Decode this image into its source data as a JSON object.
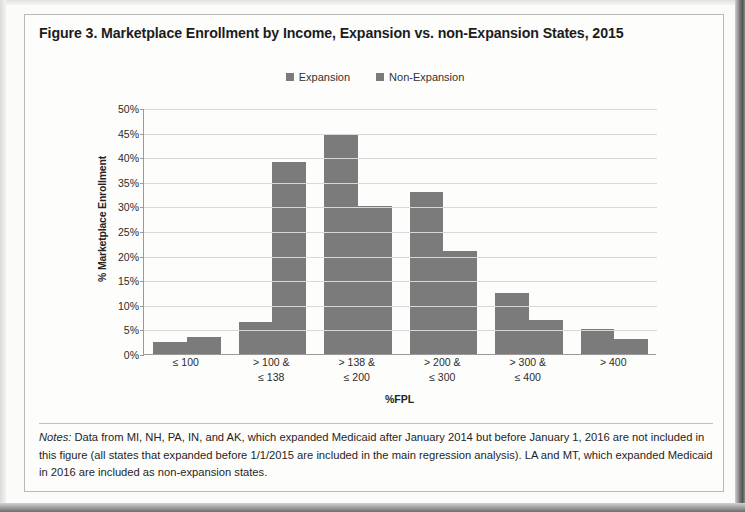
{
  "figure": {
    "title": "Figure 3. Marketplace Enrollment by Income, Expansion vs. non-Expansion States, 2015",
    "notes_label": "Notes:",
    "notes_text": " Data from MI, NH, PA, IN, and AK, which expanded Medicaid after January 2014 but before January 1, 2016 are not included in this figure (all states that expanded before 1/1/2015 are included in the main regression analysis). LA and MT, which expanded Medicaid in 2016 are included as non-expansion states."
  },
  "legend": {
    "position": "top",
    "items": [
      {
        "label": "Expansion",
        "color": "#7b7b7b"
      },
      {
        "label": "Non-Expansion",
        "color": "#7b7b7b"
      }
    ]
  },
  "chart_data": {
    "type": "bar",
    "title": "Figure 3. Marketplace Enrollment by Income, Expansion vs. non-Expansion States, 2015",
    "xlabel": "%FPL",
    "ylabel": "% Marketplace Enrollment",
    "categories": [
      "≤ 100",
      "> 100 &\n≤ 138",
      "> 138 &\n≤ 200",
      "> 200 &\n≤ 300",
      "> 300 &\n≤ 400",
      "> 400"
    ],
    "category_lines": [
      [
        "≤ 100",
        ""
      ],
      [
        "> 100 &",
        "≤ 138"
      ],
      [
        "> 138 &",
        "≤ 200"
      ],
      [
        "> 200 &",
        "≤ 300"
      ],
      [
        "> 300 &",
        "≤ 400"
      ],
      [
        "> 400",
        ""
      ]
    ],
    "series": [
      {
        "name": "Expansion",
        "color": "#7b7b7b",
        "values": [
          2.5,
          6.5,
          44.5,
          33.0,
          12.5,
          5.0
        ]
      },
      {
        "name": "Non-Expansion",
        "color": "#7b7b7b",
        "values": [
          3.5,
          39.0,
          30.0,
          21.0,
          7.0,
          3.0
        ]
      }
    ],
    "ylim": [
      0,
      50
    ],
    "ytick_values": [
      50,
      45,
      40,
      35,
      30,
      25,
      20,
      15,
      10,
      5,
      0
    ],
    "ytick_labels": [
      "50%",
      "45%",
      "40%",
      "35%",
      "30%",
      "25%",
      "20%",
      "15%",
      "10%",
      "5%",
      "0%"
    ],
    "grid": true,
    "legend_position": "top-center"
  }
}
